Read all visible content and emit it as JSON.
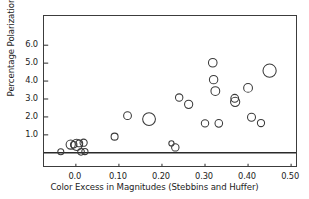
{
  "chart_data": {
    "type": "scatter",
    "title": "",
    "xlabel": "Color Excess in Magnitudes (Stebbins and Huffer)",
    "ylabel": "Percentage Polarization",
    "xlim": [
      -0.074,
      0.516
    ],
    "ylim": [
      -0.85,
      7.63
    ],
    "grid": false,
    "legend": null,
    "xticks": [
      0.0,
      0.1,
      0.2,
      0.3,
      0.4,
      0.5
    ],
    "xticklabels": [
      "0.0",
      "0.10",
      "0.20",
      "0.30",
      "0.40",
      "0.50"
    ],
    "yticks": [
      1.0,
      2.0,
      3.0,
      4.0,
      5.0,
      6.0
    ],
    "yticklabels": [
      "1.0",
      "2.0",
      "3.0",
      "4.0",
      "5.0",
      "6.0"
    ],
    "marker": "open-circle",
    "marker_size_meaning": "variable symbol size",
    "reference_line": {
      "orientation": "horizontal",
      "y": 0.0,
      "label": "zero polarization"
    },
    "points": [
      {
        "x": -0.035,
        "y": 0.06,
        "r": 3.0
      },
      {
        "x": -0.012,
        "y": 0.46,
        "r": 4.6
      },
      {
        "x": -0.005,
        "y": 0.45,
        "r": 3.2
      },
      {
        "x": 0.002,
        "y": 0.44,
        "r": 5.6
      },
      {
        "x": 0.008,
        "y": 0.52,
        "r": 3.4
      },
      {
        "x": 0.012,
        "y": 0.05,
        "r": 3.3
      },
      {
        "x": 0.018,
        "y": 0.56,
        "r": 3.6
      },
      {
        "x": 0.021,
        "y": 0.07,
        "r": 3.1
      },
      {
        "x": 0.09,
        "y": 0.9,
        "r": 3.5
      },
      {
        "x": 0.12,
        "y": 2.07,
        "r": 3.9
      },
      {
        "x": 0.17,
        "y": 1.88,
        "r": 6.4
      },
      {
        "x": 0.222,
        "y": 0.52,
        "r": 2.6
      },
      {
        "x": 0.231,
        "y": 0.3,
        "r": 3.7
      },
      {
        "x": 0.24,
        "y": 3.08,
        "r": 3.7
      },
      {
        "x": 0.262,
        "y": 2.7,
        "r": 4.1
      },
      {
        "x": 0.3,
        "y": 1.64,
        "r": 3.7
      },
      {
        "x": 0.318,
        "y": 5.02,
        "r": 4.3
      },
      {
        "x": 0.32,
        "y": 4.08,
        "r": 4.2
      },
      {
        "x": 0.324,
        "y": 3.44,
        "r": 4.4
      },
      {
        "x": 0.332,
        "y": 1.64,
        "r": 3.8
      },
      {
        "x": 0.369,
        "y": 3.04,
        "r": 3.9
      },
      {
        "x": 0.37,
        "y": 2.84,
        "r": 4.6
      },
      {
        "x": 0.4,
        "y": 3.62,
        "r": 4.4
      },
      {
        "x": 0.408,
        "y": 1.98,
        "r": 4.0
      },
      {
        "x": 0.43,
        "y": 1.66,
        "r": 3.6
      },
      {
        "x": 0.45,
        "y": 4.58,
        "r": 6.6
      }
    ]
  },
  "axes": {
    "xlabel": "Color Excess in Magnitudes (Stebbins and Huffer)",
    "ylabel": "Percentage Polarization"
  },
  "style": {
    "marker_stroke": "#3a3a3a",
    "frame_color": "#3c3c3c",
    "zero_line_color": "#2a2a2a",
    "background": "#ffffff"
  }
}
